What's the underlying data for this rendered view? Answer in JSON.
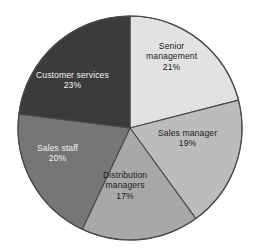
{
  "chart_data": {
    "type": "pie",
    "title": "",
    "subtitle": "",
    "xlabel": "",
    "ylabel": "",
    "legend_position": "none",
    "grid": false,
    "units": "percent",
    "start_angle_deg": 0,
    "direction": "clockwise",
    "categories": [
      "Senior management",
      "Sales manager",
      "Distribution managers",
      "Sales staff",
      "Customer services"
    ],
    "values": [
      21,
      19,
      17,
      20,
      23
    ],
    "value_labels": [
      "21%",
      "19%",
      "17%",
      "20%",
      "23%"
    ],
    "slices": [
      {
        "id": "senior-management",
        "label": "Senior management",
        "label_line1": "Senior",
        "label_line2": "management",
        "value": 21,
        "value_label": "21%",
        "color": "#e2e2e2",
        "text_color": "#1c1c1c",
        "label_left": 146,
        "label_top": 41
      },
      {
        "id": "sales-manager",
        "label": "Sales manager",
        "label_line1": "Sales manager",
        "label_line2": "",
        "value": 19,
        "value_label": "19%",
        "color": "#bcbcbc",
        "text_color": "#1c1c1c",
        "label_left": 158,
        "label_top": 128
      },
      {
        "id": "distribution-managers",
        "label": "Distribution managers",
        "label_line1": "Distribution",
        "label_line2": "managers",
        "value": 17,
        "value_label": "17%",
        "color": "#a8a8a8",
        "text_color": "#1c1c1c",
        "label_left": 103,
        "label_top": 170
      },
      {
        "id": "sales-staff",
        "label": "Sales staff",
        "label_line1": "Sales staff",
        "label_line2": "",
        "value": 20,
        "value_label": "20%",
        "color": "#767676",
        "text_color": "#f2f2f2",
        "label_left": 37,
        "label_top": 143
      },
      {
        "id": "customer-services",
        "label": "Customer services",
        "label_line1": "Customer services",
        "label_line2": "",
        "value": 23,
        "value_label": "23%",
        "color": "#3b3b3b",
        "text_color": "#f2f2f2",
        "label_left": 36,
        "label_top": 70
      }
    ],
    "geometry": {
      "center_x": 130,
      "center_y": 128,
      "radius": 112
    },
    "stroke_color": "#4a4a4a",
    "background": "#ffffff"
  }
}
